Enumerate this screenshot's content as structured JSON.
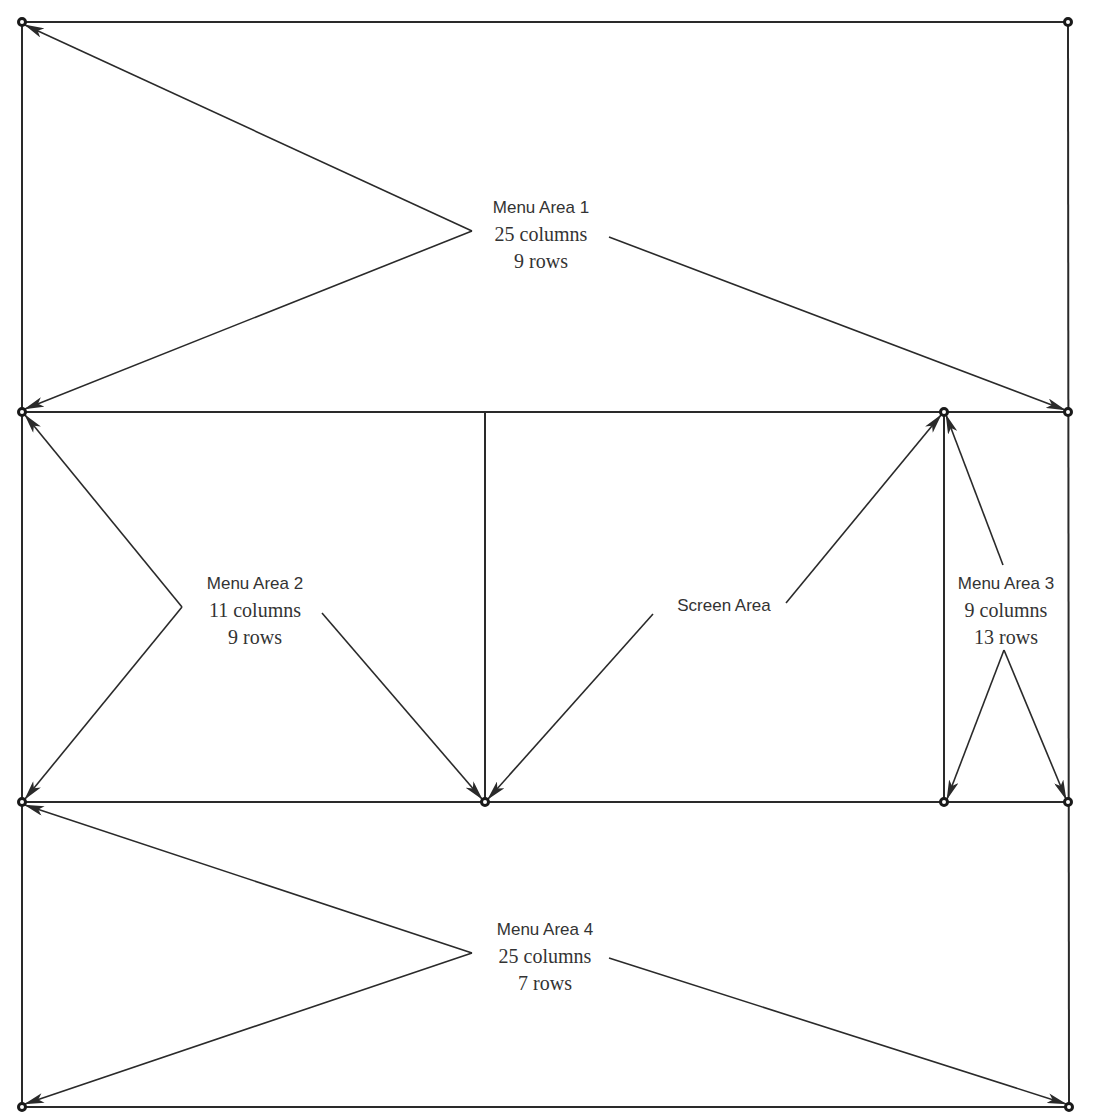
{
  "diagram": {
    "type": "screen-layout",
    "colors": {
      "line": "#2a2a2a",
      "text": "#333333",
      "background": "#ffffff"
    },
    "areas": [
      {
        "name": "Menu Area 1",
        "columns": "25 columns",
        "rows": "9 rows"
      },
      {
        "name": "Menu Area 2",
        "columns": "11 columns",
        "rows": "9 rows"
      },
      {
        "name": "Screen Area"
      },
      {
        "name": "Menu Area 3",
        "columns": "9 columns",
        "rows": "13 rows"
      },
      {
        "name": "Menu Area 4",
        "columns": "25 columns",
        "rows": "7 rows"
      }
    ]
  }
}
